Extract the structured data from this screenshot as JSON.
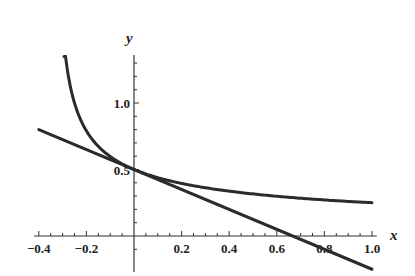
{
  "chart_data": {
    "type": "line",
    "title": "",
    "xlabel": "x",
    "ylabel": "y",
    "xlim": [
      -0.4,
      1.0
    ],
    "ylim": [
      -0.15,
      1.4
    ],
    "grid": false,
    "legend": null,
    "x_ticks": [
      -0.4,
      -0.2,
      0.2,
      0.4,
      0.6,
      0.8,
      1.0
    ],
    "x_tick_labels": [
      "−0.4",
      "−0.2",
      "0.2",
      "0.4",
      "0.6",
      "0.8",
      "1.0"
    ],
    "y_ticks": [
      0.5,
      1.0
    ],
    "y_tick_labels": [
      "0.5",
      "1.0"
    ],
    "series": [
      {
        "name": "curve",
        "description": "decreasing curve with vertical asymptote near x = -1/3, tangent to line at (0, 0.5)",
        "x": [
          -0.29,
          -0.25,
          -0.2,
          -0.15,
          -0.1,
          -0.05,
          0.0,
          0.1,
          0.2,
          0.4,
          0.6,
          0.8,
          1.0
        ],
        "y": [
          1.35,
          1.0,
          0.79,
          0.68,
          0.6,
          0.54,
          0.5,
          0.44,
          0.4,
          0.35,
          0.31,
          0.28,
          0.25
        ]
      },
      {
        "name": "tangent line",
        "description": "straight line through (0, 0.5) with slope -0.75",
        "x": [
          -0.4,
          0.0,
          0.6667,
          1.0
        ],
        "y": [
          0.8,
          0.5,
          0.0,
          -0.25
        ]
      }
    ],
    "annotations": [
      {
        "text": "point of tangency",
        "x": 0,
        "y": 0.5
      }
    ]
  },
  "axes": {
    "x_label": "x",
    "y_label": "y"
  }
}
